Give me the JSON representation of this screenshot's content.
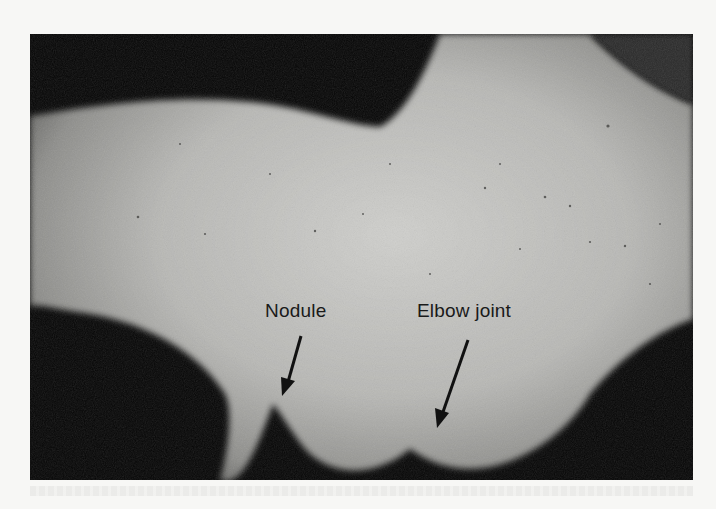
{
  "figure": {
    "labels": [
      {
        "text": "Nodule"
      },
      {
        "text": "Elbow joint"
      }
    ],
    "colors": {
      "background": "#050505",
      "skin_light": "#c9c9c6",
      "skin_mid": "#9a9a97",
      "label_text": "#1a1a1a",
      "arrow": "#111111"
    }
  }
}
